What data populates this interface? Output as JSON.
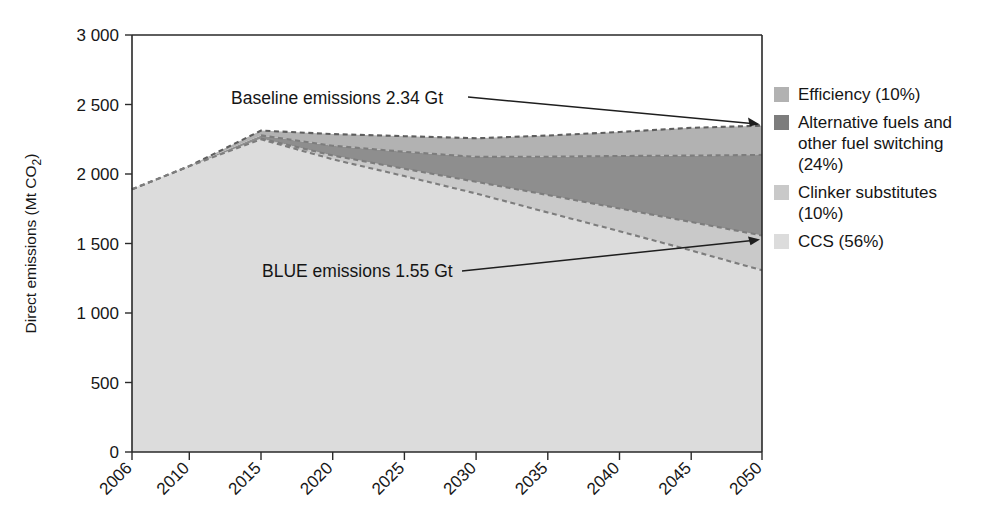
{
  "chart_data": {
    "type": "area",
    "title": "",
    "subtitle": "",
    "xlabel": "",
    "ylabel": "Direct emissions (Mt CO2)",
    "ylabel_parts": {
      "main": "Direct emissions (Mt CO",
      "sub": "2",
      "tail": ")"
    },
    "x": [
      2006,
      2010,
      2015,
      2020,
      2025,
      2030,
      2035,
      2040,
      2045,
      2050
    ],
    "categories": [
      "2006",
      "2010",
      "2015",
      "2020",
      "2025",
      "2030",
      "2035",
      "2040",
      "2045",
      "2050"
    ],
    "xtick_labels": [
      "2006",
      "2010",
      "2015",
      "2020",
      "2025",
      "2030",
      "2035",
      "2040",
      "2045",
      "2050"
    ],
    "ytick_labels": [
      "0",
      "500",
      "1 000",
      "1 500",
      "2 000",
      "2 500",
      "3 000"
    ],
    "ytick_values": [
      0,
      500,
      1000,
      1500,
      2000,
      2500,
      3000
    ],
    "ylim": [
      0,
      3000
    ],
    "xlim": [
      2006,
      2050
    ],
    "grid": false,
    "legend_position": "right",
    "stacking": "from-bottom-up: CCS, Clinker substitutes, Alternative fuels and other fuel switching, Efficiency",
    "baseline_curve": {
      "name": "Baseline emissions",
      "values": [
        1890,
        2050,
        2310,
        2285,
        2270,
        2255,
        2275,
        2300,
        2330,
        2345
      ]
    },
    "blue_curve": {
      "name": "BLUE emissions",
      "values": [
        1890,
        2050,
        2250,
        2150,
        2075,
        2000,
        1890,
        1780,
        1670,
        1550
      ]
    },
    "series": [
      {
        "name": "CCS",
        "percent": "56%",
        "color": "#d9d9d9",
        "values": [
          1890,
          2050,
          2250,
          2106,
          1985,
          1860,
          1723,
          1589,
          1450,
          1308
        ]
      },
      {
        "name": "Clinker substitutes",
        "percent": "10%",
        "color": "#c7c7c7",
        "values": [
          1890,
          2050,
          2255,
          2133,
          2037,
          1944,
          1849,
          1752,
          1655,
          1558
        ]
      },
      {
        "name": "Alternative fuels and other fuel switching",
        "percent": "24%",
        "color": "#8e8e8e",
        "values": [
          1890,
          2050,
          2278,
          2204,
          2160,
          2123,
          2125,
          2130,
          2133,
          2138
        ]
      },
      {
        "name": "Efficiency",
        "percent": "10%",
        "color": "#b0b0b0",
        "values": [
          1890,
          2050,
          2310,
          2285,
          2270,
          2255,
          2275,
          2300,
          2330,
          2345
        ]
      }
    ],
    "annotations": [
      {
        "text": "Baseline emissions 2.34 Gt",
        "value_gt": 2.34,
        "points_to_year": 2050,
        "points_to_value": 2345
      },
      {
        "text": "BLUE emissions 1.55 Gt",
        "value_gt": 1.55,
        "points_to_year": 2050,
        "points_to_value": 1550
      }
    ]
  },
  "legend": {
    "items": [
      {
        "label": "Efficiency (10%)",
        "color": "#b0b0b0"
      },
      {
        "label": "Alternative fuels and\nother fuel switching\n(24%)",
        "color": "#7d7d7d"
      },
      {
        "label": "Clinker substitutes\n(10%)",
        "color": "#c7c7c7"
      },
      {
        "label": "CCS (56%)",
        "color": "#d9d9d9"
      }
    ]
  },
  "colors": {
    "axis": "#2a2a2a",
    "text": "#151515",
    "background": "#ffffff",
    "efficiency": "#b0b0b0",
    "alt_fuels": "#8e8e8e",
    "clinker": "#c7c7c7",
    "ccs": "#d9d9d9"
  }
}
